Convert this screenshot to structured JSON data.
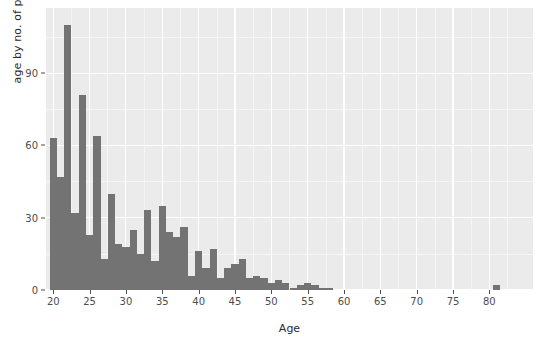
{
  "chart_data": {
    "type": "bar",
    "title": "",
    "subtitle": "",
    "xlabel": "Age",
    "ylabel": "age by no. of people",
    "xlim": [
      19,
      86
    ],
    "ylim": [
      0,
      117
    ],
    "grid": true,
    "legend": null,
    "bin_width": 1,
    "x_ticks": [
      20,
      25,
      30,
      35,
      40,
      45,
      50,
      55,
      60,
      65,
      70,
      75,
      80
    ],
    "y_ticks": [
      0,
      30,
      60,
      90
    ],
    "bar_color": "#737373",
    "panel_color": "#ebebeb",
    "gridline_color": "#ffffff",
    "categories": [
      20,
      21,
      22,
      23,
      24,
      25,
      26,
      27,
      28,
      29,
      30,
      31,
      32,
      33,
      34,
      35,
      36,
      37,
      38,
      39,
      40,
      41,
      42,
      43,
      44,
      45,
      46,
      47,
      48,
      49,
      50,
      51,
      52,
      53,
      54,
      55,
      56,
      57,
      58,
      59,
      60,
      61,
      62,
      63,
      64,
      65,
      66,
      67,
      68,
      69,
      70,
      71,
      72,
      73,
      74,
      75,
      76,
      77,
      78,
      79,
      80,
      81,
      82,
      83,
      84
    ],
    "values": [
      63,
      47,
      110,
      32,
      81,
      23,
      64,
      13,
      40,
      19,
      18,
      25,
      15,
      33,
      12,
      35,
      24,
      22,
      26,
      6,
      16,
      9,
      17,
      5,
      9,
      11,
      13,
      5,
      6,
      5,
      3,
      4,
      3,
      1,
      2,
      3,
      2,
      1,
      1,
      0,
      0,
      0,
      0,
      0,
      0,
      0,
      0,
      0,
      0,
      0,
      0,
      0,
      0,
      0,
      0,
      0,
      0,
      0,
      0,
      0,
      0,
      2,
      0,
      0,
      0
    ]
  },
  "axes": {
    "y_title": "age by no. of people",
    "x_title": "Age",
    "y_tick_labels": [
      "0",
      "30",
      "60",
      "90"
    ],
    "x_tick_labels": [
      "20",
      "25",
      "30",
      "35",
      "40",
      "45",
      "50",
      "55",
      "60",
      "65",
      "70",
      "75",
      "80"
    ]
  }
}
